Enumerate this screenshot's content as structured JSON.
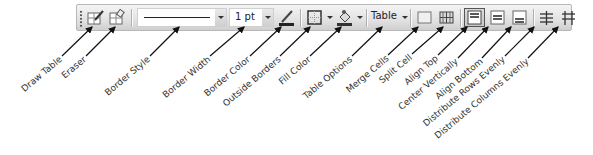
{
  "toolbar": {
    "border_style_value": "",
    "border_width_value": "1 pt",
    "table_menu_label": "Table",
    "items": [
      {
        "id": "draw-table",
        "label": "Draw Table"
      },
      {
        "id": "eraser",
        "label": "Eraser"
      },
      {
        "id": "border-style",
        "label": "Border Style"
      },
      {
        "id": "border-width",
        "label": "Border Width"
      },
      {
        "id": "border-color",
        "label": "Border Color"
      },
      {
        "id": "outside-borders",
        "label": "Outside Borders"
      },
      {
        "id": "fill-color",
        "label": "Fill Color"
      },
      {
        "id": "table-options",
        "label": "Table Options"
      },
      {
        "id": "merge-cells",
        "label": "Merge Cells"
      },
      {
        "id": "split-cell",
        "label": "Split Cell"
      },
      {
        "id": "align-top",
        "label": "Align Top"
      },
      {
        "id": "center-vertically",
        "label": "Center Vertically"
      },
      {
        "id": "align-bottom",
        "label": "Align Bottom"
      },
      {
        "id": "distribute-rows-evenly",
        "label": "Distribute Rows Evenly"
      },
      {
        "id": "distribute-columns-evenly",
        "label": "Distribute Columns Evenly"
      }
    ]
  },
  "colors": {
    "toolbar_bg_top": "#f4f4f4",
    "toolbar_bg_bottom": "#cfcfcf",
    "label_text": "#333333",
    "leader_line": "#111111"
  }
}
